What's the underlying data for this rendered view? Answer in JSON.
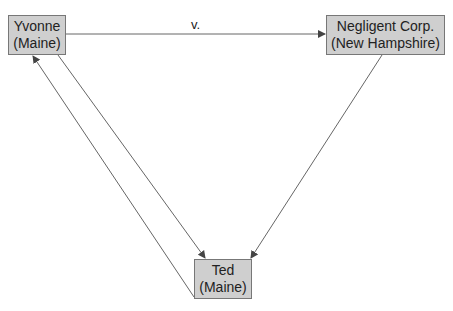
{
  "nodes": {
    "yvonne": {
      "line1": "Yvonne",
      "line2": "(Maine)"
    },
    "negligent": {
      "line1": "Negligent Corp.",
      "line2": "(New Hampshire)"
    },
    "ted": {
      "line1": "Ted",
      "line2": "(Maine)"
    }
  },
  "edges": {
    "yvonne_to_negligent": {
      "label": "v."
    }
  },
  "colors": {
    "node_fill": "#cfcfcf",
    "node_border": "#777777",
    "edge": "#555555"
  }
}
